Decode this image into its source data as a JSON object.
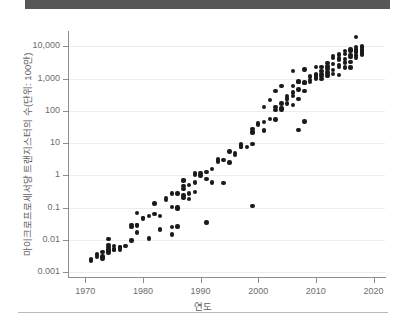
{
  "header": {
    "bar_color": "#555759"
  },
  "footer": {
    "rule_color": "#b9b9b9"
  },
  "chart_data": {
    "type": "scatter",
    "title": "",
    "xlabel": "연도",
    "ylabel": "마이크로프로세서당 트랜지스터의 수(단위: 100만)",
    "xlim": [
      1967,
      2022
    ],
    "ylim": [
      0.0007,
      30000
    ],
    "yscale": "log",
    "xscale": "linear",
    "grid": "horizontal",
    "legend": "none",
    "marker_color": "#1a1a1a",
    "xticks": [
      1970,
      1980,
      1990,
      2000,
      2010,
      2020
    ],
    "xtick_labels": [
      "1970",
      "1980",
      "1990",
      "2000",
      "2010",
      "2020"
    ],
    "yticks": [
      0.001,
      0.01,
      0.1,
      1,
      10,
      100,
      1000,
      10000
    ],
    "ytick_labels": [
      "0.001",
      "0.01",
      "0.1",
      "1",
      "10",
      "100",
      "1,000",
      "10,000"
    ],
    "points": [
      [
        1971,
        0.0023
      ],
      [
        1971,
        0.0025
      ],
      [
        1972,
        0.0035
      ],
      [
        1972,
        0.0029
      ],
      [
        1973,
        0.0042
      ],
      [
        1973,
        0.003
      ],
      [
        1973,
        0.0026
      ],
      [
        1974,
        0.005
      ],
      [
        1974,
        0.0105
      ],
      [
        1974,
        0.0045
      ],
      [
        1974,
        0.006
      ],
      [
        1974,
        0.0068
      ],
      [
        1975,
        0.0048
      ],
      [
        1975,
        0.005
      ],
      [
        1975,
        0.0052
      ],
      [
        1976,
        0.006
      ],
      [
        1976,
        0.0055
      ],
      [
        1976,
        0.0058
      ],
      [
        1977,
        0.0065
      ],
      [
        1978,
        0.029
      ],
      [
        1978,
        0.0095
      ],
      [
        1978,
        0.025
      ],
      [
        1979,
        0.029
      ],
      [
        1979,
        0.068
      ],
      [
        1979,
        0.017
      ],
      [
        1980,
        0.048
      ],
      [
        1980,
        0.0455
      ],
      [
        1981,
        0.055
      ],
      [
        1981,
        0.011
      ],
      [
        1982,
        0.134
      ],
      [
        1982,
        0.062
      ],
      [
        1983,
        0.021
      ],
      [
        1984,
        0.2
      ],
      [
        1984,
        0.17
      ],
      [
        1985,
        0.275
      ],
      [
        1985,
        0.105
      ],
      [
        1985,
        0.0145
      ],
      [
        1985,
        0.025
      ],
      [
        1986,
        0.026
      ],
      [
        1986,
        0.273
      ],
      [
        1986,
        0.095
      ],
      [
        1987,
        0.73
      ],
      [
        1987,
        0.38
      ],
      [
        1987,
        0.46
      ],
      [
        1987,
        0.24
      ],
      [
        1987,
        0.195
      ],
      [
        1988,
        0.275
      ],
      [
        1988,
        0.185
      ],
      [
        1989,
        1.18
      ],
      [
        1989,
        1.05
      ],
      [
        1989,
        0.6
      ],
      [
        1989,
        0.3
      ],
      [
        1990,
        1.2
      ],
      [
        1991,
        1.25
      ],
      [
        1991,
        0.78
      ],
      [
        1991,
        0.034
      ],
      [
        1992,
        1.55
      ],
      [
        1992,
        0.6
      ],
      [
        1993,
        3.1
      ],
      [
        1993,
        2.7
      ],
      [
        1994,
        3.0
      ],
      [
        1994,
        0.59
      ],
      [
        1995,
        5.5
      ],
      [
        1995,
        2.5
      ],
      [
        1996,
        4.3
      ],
      [
        1997,
        7.5
      ],
      [
        1997,
        9.5
      ],
      [
        1997,
        8.8
      ],
      [
        1997,
        7.8
      ],
      [
        1998,
        7.5
      ],
      [
        1999,
        9.5
      ],
      [
        1999,
        21.3
      ],
      [
        1999,
        28.0
      ],
      [
        1999,
        22.0
      ],
      [
        1999,
        0.11
      ],
      [
        2000,
        42.0
      ],
      [
        2000,
        37.5
      ],
      [
        2001,
        45.0
      ],
      [
        2001,
        25.0
      ],
      [
        2002,
        220.0
      ],
      [
        2002,
        55.0
      ],
      [
        2003,
        54.0
      ],
      [
        2003,
        105.0
      ],
      [
        2003,
        410.0
      ],
      [
        2003,
        130.0
      ],
      [
        2004,
        592.0
      ],
      [
        2004,
        125.0
      ],
      [
        2004,
        112.0
      ],
      [
        2004,
        169.0
      ],
      [
        2005,
        291.0
      ],
      [
        2005,
        230.0
      ],
      [
        2005,
        169.0
      ],
      [
        2006,
        1700.0
      ],
      [
        2006,
        582.0
      ],
      [
        2006,
        291.0
      ],
      [
        2006,
        376.0
      ],
      [
        2006,
        151.0
      ],
      [
        2007,
        805.0
      ],
      [
        2007,
        463.0
      ],
      [
        2007,
        789.0
      ],
      [
        2007,
        26.0
      ],
      [
        2007,
        234.0
      ],
      [
        2008,
        1900.0
      ],
      [
        2008,
        731.0
      ],
      [
        2008,
        758.0
      ],
      [
        2008,
        410.0
      ],
      [
        2008,
        47.0
      ],
      [
        2009,
        904.0
      ],
      [
        2009,
        774.0
      ],
      [
        2010,
        1170.0
      ],
      [
        2010,
        1400.0
      ],
      [
        2010,
        1000.0
      ],
      [
        2010,
        2300.0
      ],
      [
        2010,
        1300.0
      ],
      [
        2011,
        2270.0
      ],
      [
        2011,
        1200.0
      ],
      [
        2011,
        1750.0
      ],
      [
        2011,
        995.0
      ],
      [
        2011,
        1400.0
      ],
      [
        2012,
        3100.0
      ],
      [
        2012,
        2400.0
      ],
      [
        2012,
        1400.0
      ],
      [
        2012,
        1200.0
      ],
      [
        2012,
        2000.0
      ],
      [
        2013,
        4310.0
      ],
      [
        2013,
        1860.0
      ],
      [
        2013,
        1400.0
      ],
      [
        2013,
        2900.0
      ],
      [
        2013,
        5000.0
      ],
      [
        2014,
        5560.0
      ],
      [
        2014,
        4200.0
      ],
      [
        2014,
        3800.0
      ],
      [
        2014,
        2600.0
      ],
      [
        2014,
        1300.0
      ],
      [
        2015,
        7200.0
      ],
      [
        2015,
        5700.0
      ],
      [
        2015,
        3200.0
      ],
      [
        2015,
        4000.0
      ],
      [
        2015,
        2200.0
      ],
      [
        2016,
        7100.0
      ],
      [
        2016,
        8000.0
      ],
      [
        2016,
        5400.0
      ],
      [
        2016,
        3300.0
      ],
      [
        2016,
        4800.0
      ],
      [
        2017,
        19200.0
      ],
      [
        2017,
        8000.0
      ],
      [
        2017,
        6900.0
      ],
      [
        2017,
        5300.0
      ],
      [
        2017,
        9700.0
      ],
      [
        2017,
        7000.0
      ],
      [
        2018,
        9700.0
      ],
      [
        2018,
        8000.0
      ],
      [
        2018,
        6800.0
      ],
      [
        2018,
        5400.0
      ],
      [
        2018,
        6000.0
      ],
      [
        2018,
        10000.0
      ],
      [
        1974,
        0.004
      ],
      [
        1975,
        0.0065
      ],
      [
        1976,
        0.0049
      ],
      [
        1979,
        0.028
      ],
      [
        1983,
        0.054
      ],
      [
        1986,
        0.1
      ],
      [
        1987,
        0.68
      ],
      [
        1988,
        0.5
      ],
      [
        1990,
        1.0
      ],
      [
        1996,
        5.0
      ],
      [
        2001,
        130.0
      ],
      [
        2005,
        240.0
      ],
      [
        2009,
        1170.0
      ],
      [
        2012,
        1600.0
      ],
      [
        2014,
        2300.0
      ],
      [
        2016,
        2200.0
      ],
      [
        2017,
        4300.0
      ],
      [
        2018,
        7000.0
      ]
    ]
  }
}
